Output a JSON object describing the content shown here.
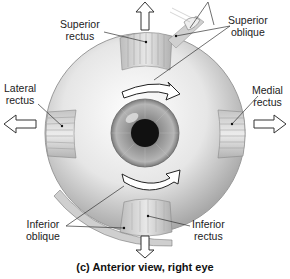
{
  "figure": {
    "caption": "(c) Anterior view, right eye",
    "labels": {
      "superior_rectus": [
        "Superior",
        "rectus"
      ],
      "superior_oblique": [
        "Superior",
        "oblique"
      ],
      "lateral_rectus": [
        "Lateral",
        "rectus"
      ],
      "medial_rectus": [
        "Medial",
        "rectus"
      ],
      "inferior_oblique": [
        "Inferior",
        "oblique"
      ],
      "inferior_rectus": [
        "Inferior",
        "rectus"
      ]
    },
    "arrows": {
      "up": "superior rectus pull",
      "down": "inferior rectus pull",
      "left": "lateral rectus pull",
      "right": "medial rectus pull",
      "rotation_upper": "superior oblique rotation",
      "rotation_lower": "inferior oblique rotation"
    }
  }
}
